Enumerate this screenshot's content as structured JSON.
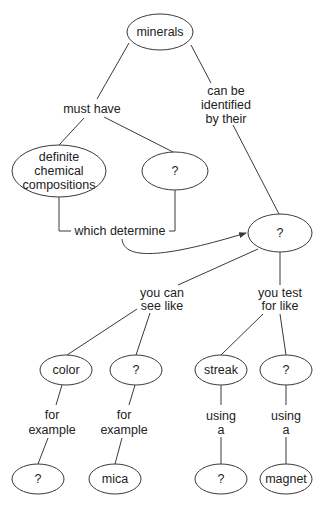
{
  "diagram": {
    "type": "concept-map",
    "background": "#ffffff",
    "stroke_color": "#3a3a3a",
    "text_color": "#222222",
    "nodes": {
      "minerals": {
        "label": "minerals"
      },
      "compositions": {
        "lines": [
          "definite",
          "chemical",
          "compositions"
        ]
      },
      "unknown_structure": {
        "label": "?"
      },
      "properties": {
        "label": "?"
      },
      "color": {
        "label": "color"
      },
      "visible_unknown": {
        "label": "?"
      },
      "streak": {
        "label": "streak"
      },
      "test_unknown": {
        "label": "?"
      },
      "color_example": {
        "label": "?"
      },
      "mica": {
        "label": "mica"
      },
      "streak_tool": {
        "label": "?"
      },
      "magnet": {
        "label": "magnet"
      }
    },
    "links": {
      "must_have": {
        "label": "must have"
      },
      "identified_by": {
        "lines": [
          "can be",
          "identified",
          "by their"
        ]
      },
      "which_determine": {
        "label": "which determine"
      },
      "see_like": {
        "lines": [
          "you can",
          "see like"
        ]
      },
      "test_like": {
        "lines": [
          "you test",
          "for like"
        ]
      },
      "for_example_1": {
        "lines": [
          "for",
          "example"
        ]
      },
      "for_example_2": {
        "lines": [
          "for",
          "example"
        ]
      },
      "using_a_1": {
        "lines": [
          "using",
          "a"
        ]
      },
      "using_a_2": {
        "lines": [
          "using",
          "a"
        ]
      }
    }
  }
}
